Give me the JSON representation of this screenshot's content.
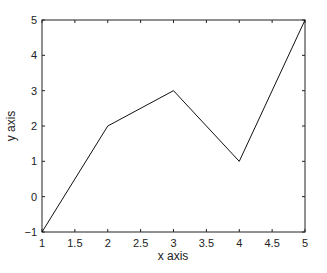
{
  "chart_data": {
    "type": "line",
    "title": "",
    "xlabel": "x axis",
    "ylabel": "y axis",
    "x": [
      1,
      2,
      3,
      4,
      5
    ],
    "series": [
      {
        "name": "data",
        "values": [
          -1,
          2,
          3,
          1,
          5
        ],
        "color": "#111111"
      }
    ],
    "xlim": [
      1,
      5
    ],
    "ylim": [
      -1,
      5
    ],
    "xticks": [
      1,
      1.5,
      2,
      2.5,
      3,
      3.5,
      4,
      4.5,
      5
    ],
    "xtick_labels": [
      "1",
      "1.5",
      "2",
      "2.5",
      "3",
      "3.5",
      "4",
      "4.5",
      "5"
    ],
    "yticks": [
      -1,
      0,
      1,
      2,
      3,
      4,
      5
    ],
    "ytick_labels": [
      "-1",
      "0",
      "1",
      "2",
      "3",
      "4",
      "5"
    ],
    "grid": false,
    "legend": null
  }
}
